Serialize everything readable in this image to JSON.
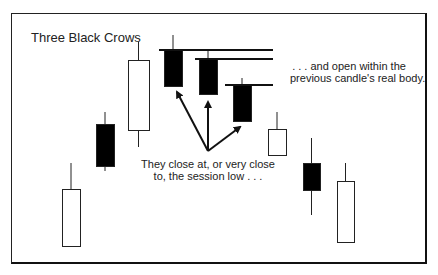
{
  "diagram": {
    "title": "Three Black Crows",
    "notes": {
      "open_within": {
        "line1": ". . . and open within the",
        "line2": "previous candle's real body."
      },
      "close_low": {
        "line1": "They close at, or very close",
        "line2": "to, the session low . . ."
      }
    },
    "colors": {
      "bearish_fill": "#000000",
      "bullish_fill": "#ffffff",
      "stroke": "#222222"
    },
    "candles": [
      {
        "type": "bullish",
        "x": 62,
        "w": 18,
        "wick_top": 163,
        "body_top": 189,
        "body_bottom": 246,
        "wick_bottom": 246
      },
      {
        "type": "bearish",
        "x": 96,
        "w": 18,
        "wick_top": 112,
        "body_top": 124,
        "body_bottom": 166,
        "wick_bottom": 171
      },
      {
        "type": "bullish",
        "x": 128,
        "w": 21,
        "wick_top": 42,
        "body_top": 60,
        "body_bottom": 130,
        "wick_bottom": 147
      },
      {
        "type": "bearish",
        "x": 164,
        "w": 18,
        "wick_top": 35,
        "body_top": 50,
        "body_bottom": 86,
        "wick_bottom": 86,
        "crow": 1
      },
      {
        "type": "bearish",
        "x": 199,
        "w": 18,
        "wick_top": 50,
        "body_top": 59,
        "body_bottom": 94,
        "wick_bottom": 94,
        "crow": 2
      },
      {
        "type": "bearish",
        "x": 233,
        "w": 18,
        "wick_top": 78,
        "body_top": 85,
        "body_bottom": 121,
        "wick_bottom": 121,
        "crow": 3
      },
      {
        "type": "bullish",
        "x": 268,
        "w": 18,
        "wick_top": 112,
        "body_top": 129,
        "body_bottom": 155,
        "wick_bottom": 155
      },
      {
        "type": "bearish",
        "x": 303,
        "w": 17,
        "wick_top": 138,
        "body_top": 163,
        "body_bottom": 190,
        "wick_bottom": 215
      },
      {
        "type": "bullish",
        "x": 337,
        "w": 17,
        "wick_top": 163,
        "body_top": 181,
        "body_bottom": 242,
        "wick_bottom": 242
      }
    ],
    "open_lines": [
      {
        "x1": 159,
        "x2": 273,
        "y": 50
      },
      {
        "x1": 195,
        "x2": 273,
        "y": 59
      },
      {
        "x1": 225,
        "x2": 273,
        "y": 85
      }
    ],
    "arrows": {
      "origin": [
        208,
        151
      ],
      "tips": [
        [
          177,
          92
        ],
        [
          208,
          102
        ],
        [
          240,
          127
        ]
      ]
    }
  }
}
